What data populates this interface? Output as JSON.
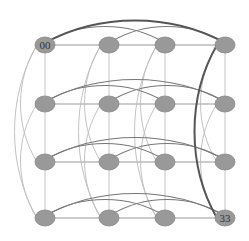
{
  "diagram": {
    "type": "grid-graph",
    "rows": 4,
    "cols": 4,
    "col_x": [
      45,
      109,
      165,
      225
    ],
    "row_y": [
      45,
      104,
      162,
      218
    ],
    "node": {
      "rx": 10,
      "ry": 8,
      "fill": "#999999",
      "stroke": "#888888"
    },
    "labels": [
      {
        "row": 0,
        "col": 0,
        "text": "00"
      },
      {
        "row": 3,
        "col": 3,
        "text": "33"
      }
    ],
    "edge_colors": {
      "straight": "#999999",
      "row_arc": "#777777",
      "col_arc": "#bbbbbb",
      "highlight": "#555555"
    },
    "arcs_within_line": [
      [
        0,
        2
      ],
      [
        0,
        3
      ],
      [
        1,
        3
      ]
    ],
    "highlight_edges": [
      {
        "type": "row",
        "index": 0,
        "from": 0,
        "to": 3
      },
      {
        "type": "col",
        "index": 3,
        "from": 0,
        "to": 3
      }
    ]
  }
}
